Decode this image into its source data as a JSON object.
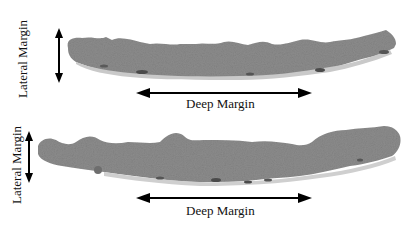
{
  "figure": {
    "panels": [
      {
        "id": "top",
        "lateral_label": "Lateral Margin",
        "deep_label": "Deep Margin"
      },
      {
        "id": "bottom",
        "lateral_label": "Lateral Margin",
        "deep_label": "Deep Margin"
      }
    ],
    "colors": {
      "tissue": "#8a8a8a",
      "tissue_dark": "#5f5f5f",
      "tissue_light": "#b8b8b8",
      "arrow": "#000000",
      "background": "#ffffff"
    }
  }
}
